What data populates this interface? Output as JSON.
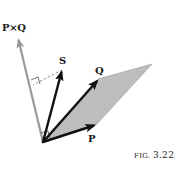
{
  "figure": {
    "caption_prefix": "FIG.",
    "caption_number": "3.22",
    "labels": {
      "cross_product": "P×Q",
      "s": "S",
      "q": "Q",
      "p": "P"
    },
    "vectors": [
      {
        "name": "P",
        "from": [
          43,
          142
        ],
        "to": [
          96,
          125
        ],
        "color": "#111111"
      },
      {
        "name": "Q",
        "from": [
          43,
          142
        ],
        "to": [
          98,
          79
        ],
        "color": "#111111"
      },
      {
        "name": "S",
        "from": [
          43,
          142
        ],
        "to": [
          62,
          70
        ],
        "color": "#111111"
      },
      {
        "name": "P×Q",
        "from": [
          43,
          142
        ],
        "to": [
          18,
          38
        ],
        "color": "#9a9a9a"
      }
    ],
    "parallelogram": {
      "points": [
        [
          43,
          142
        ],
        [
          96,
          125
        ],
        [
          152,
          64
        ],
        [
          98,
          79
        ]
      ],
      "fill": "#bdbdbd"
    },
    "projection": {
      "from": [
        62,
        70
      ],
      "to": [
        33,
        85
      ],
      "style": "dashed"
    }
  }
}
